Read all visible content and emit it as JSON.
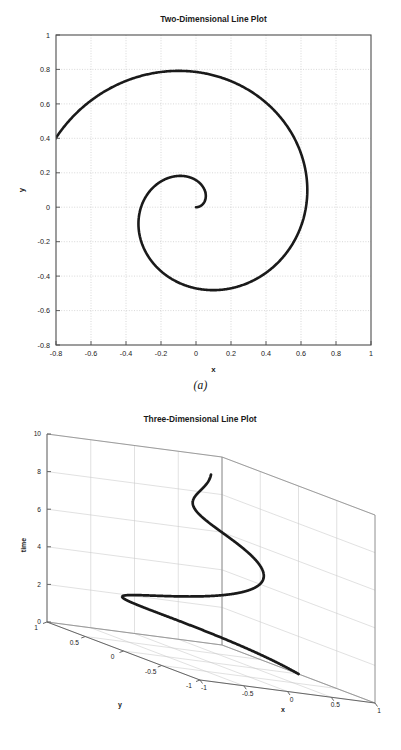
{
  "document": {
    "background_color": "#ffffff",
    "line_color": "#1a1a1a",
    "grid_color": "#bdbdbd",
    "axis_color": "#4d4d4d"
  },
  "figures": [
    {
      "id": "fig-2d",
      "caption": "(a)",
      "title": "Two-Dimensional Line Plot"
    },
    {
      "id": "fig-3d",
      "caption": "(b)",
      "title": "Three-Dimensional Line Plot"
    }
  ],
  "captions": {
    "a": "(a)",
    "b": "(b)"
  },
  "chart_data": [
    {
      "type": "line",
      "title": "Two-Dimensional Line Plot",
      "xlabel": "x",
      "ylabel": "y",
      "xlim": [
        -0.8,
        1
      ],
      "ylim": [
        -0.8,
        1
      ],
      "xticks": [
        -0.8,
        -0.6,
        -0.4,
        -0.2,
        0,
        0.2,
        0.4,
        0.6,
        0.8,
        1
      ],
      "xticklabels": [
        "-0.8",
        "-0.6",
        "-0.4",
        "-0.2",
        "0",
        "0.2",
        "0.4",
        "0.6",
        "0.8",
        "1"
      ],
      "yticks": [
        -0.8,
        -0.6,
        -0.4,
        -0.2,
        0,
        0.2,
        0.4,
        0.6,
        0.8,
        1
      ],
      "yticklabels": [
        "-0.8",
        "-0.6",
        "-0.4",
        "-0.2",
        "0",
        "0.2",
        "0.4",
        "0.6",
        "0.8",
        "1"
      ],
      "grid": true,
      "grid_style": "dotted",
      "legend": null,
      "series": [
        {
          "name": "spiral",
          "description": "Archimedean-like spiral x = r(t)cos(t), y = r(t)sin(t) with r growing from 0 to 1 over t = 0 to 10",
          "parametric": {
            "t_start": 0,
            "t_end": 10,
            "x_expr": "(t/10)*cos(t)",
            "y_expr": "(t/10)*sin(t)"
          },
          "x": [
            0.0,
            0.049,
            0.083,
            0.079,
            0.026,
            -0.071,
            -0.192,
            -0.311,
            -0.395,
            -0.416,
            -0.36,
            -0.231,
            -0.053,
            0.132,
            0.283,
            0.364,
            0.356,
            0.261,
            0.104,
            -0.079,
            -0.246,
            -0.359,
            -0.394,
            -0.345,
            -0.224,
            -0.058,
            0.118,
            0.265,
            0.351,
            0.358,
            0.286,
            0.154,
            -0.01,
            -0.17,
            -0.289,
            -0.344,
            -0.325,
            -0.239,
            -0.106,
            0.044,
            0.18,
            0.273,
            0.308,
            0.28,
            0.196,
            0.077,
            -0.054,
            -0.169,
            -0.243,
            -0.263,
            -0.227,
            -0.145,
            -0.037,
            0.073,
            0.157,
            0.196,
            0.185,
            0.128,
            0.042,
            -0.051,
            -0.126,
            -0.164,
            -0.155,
            -0.104,
            -0.027,
            0.054,
            0.113,
            0.133,
            0.111,
            0.056,
            -0.013,
            -0.073,
            -0.105,
            -0.098,
            -0.055,
            0.005,
            0.058,
            0.085,
            0.075,
            0.034,
            -0.018,
            -0.06,
            -0.072,
            -0.05,
            -0.005,
            0.039,
            0.06,
            0.048,
            0.011,
            -0.03,
            -0.052,
            -0.044,
            -0.011,
            0.026,
            0.045,
            0.034,
            0.002,
            -0.028,
            -0.037,
            -0.021,
            0.0
          ],
          "y": [
            0.0,
            0.0,
            0.0,
            0.0,
            0.0,
            0.0,
            0.0,
            0.0,
            0.0,
            0.0,
            0.0,
            0.0,
            0.0,
            0.0,
            0.0,
            0.0,
            0.0,
            0.0,
            0.0,
            0.0,
            0.0,
            0.0,
            0.0,
            0.0,
            0.0,
            0.0,
            0.0,
            0.0,
            0.0,
            0.0,
            0.0,
            0.0,
            0.0,
            0.0,
            0.0,
            0.0,
            0.0,
            0.0,
            0.0,
            0.0,
            0.0,
            0.0,
            0.0,
            0.0,
            0.0,
            0.0,
            0.0,
            0.0,
            0.0,
            0.0,
            0.0,
            0.0,
            0.0,
            0.0,
            0.0,
            0.0,
            0.0,
            0.0,
            0.0,
            0.0,
            0.0,
            0.0,
            0.0,
            0.0,
            0.0,
            0.0,
            0.0,
            0.0,
            0.0,
            0.0,
            0.0,
            0.0,
            0.0,
            0.0,
            0.0,
            0.0,
            0.0,
            0.0,
            0.0,
            0.0,
            0.0,
            0.0,
            0.0,
            0.0,
            0.0,
            0.0,
            0.0,
            0.0,
            0.0,
            0.0,
            0.0,
            0.0,
            0.0,
            0.0,
            0.0,
            0.0,
            0.0,
            0.0,
            0.0,
            0.0,
            0.0
          ],
          "endpoint_note": "Curve starts near the origin (0.07, 0.10) and spirals outward ending at (1, 0)",
          "turns": 3.2,
          "max_radius": 1.0
        }
      ]
    },
    {
      "type": "line",
      "title": "Three-Dimensional Line Plot",
      "xlabel": "x",
      "ylabel": "y",
      "zlabel": "time",
      "xlim": [
        -1,
        1
      ],
      "ylim": [
        -1,
        1
      ],
      "zlim": [
        0,
        10
      ],
      "xticks": [
        -1,
        -0.5,
        0,
        0.5,
        1
      ],
      "xticklabels": [
        "-1",
        "-0.5",
        "0",
        "0.5",
        "1"
      ],
      "yticks": [
        -1,
        -0.5,
        0,
        0.5,
        1
      ],
      "yticklabels": [
        "1",
        "0.5",
        "0",
        "-0.5",
        "-1"
      ],
      "zticks": [
        0,
        2,
        4,
        6,
        8,
        10
      ],
      "zticklabels": [
        "0",
        "2",
        "4",
        "6",
        "8",
        "10"
      ],
      "grid": true,
      "projection": "3d",
      "view": {
        "azimuth": -37.5,
        "elevation": 30
      },
      "legend": null,
      "series": [
        {
          "name": "helix-spiral",
          "description": "Conical spiral: x = r(t)cos(t), y = r(t)sin(t), z = t, with radius shrinking as time increases",
          "parametric": {
            "t_start": 0,
            "t_end": 10,
            "x_expr": "(1 - t/10)*cos(t)",
            "y_expr": "(1 - t/10)*sin(t)",
            "z_expr": "t"
          },
          "turns": 1.6,
          "start_point": [
            1,
            0,
            0
          ],
          "end_point": [
            0,
            0,
            10
          ]
        }
      ]
    }
  ]
}
